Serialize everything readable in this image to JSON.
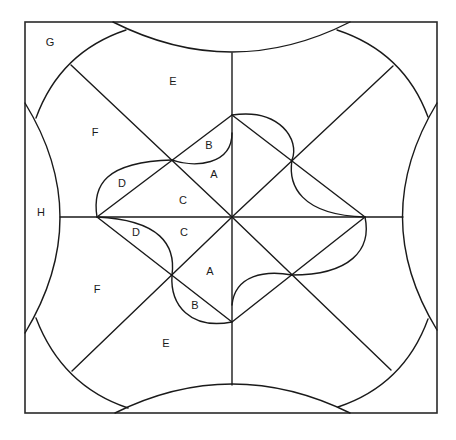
{
  "diagram": {
    "type": "quilt-block-pattern",
    "stroke_color": "#1a1a1a",
    "background": "#ffffff",
    "labels": [
      {
        "id": "G",
        "text": "G",
        "x": 50,
        "y": 42
      },
      {
        "id": "E-top",
        "text": "E",
        "x": 173,
        "y": 81
      },
      {
        "id": "F-top",
        "text": "F",
        "x": 95,
        "y": 132
      },
      {
        "id": "B-top",
        "text": "B",
        "x": 209,
        "y": 145
      },
      {
        "id": "A-top",
        "text": "A",
        "x": 214,
        "y": 174
      },
      {
        "id": "D-top",
        "text": "D",
        "x": 122,
        "y": 183
      },
      {
        "id": "C-top",
        "text": "C",
        "x": 183,
        "y": 200
      },
      {
        "id": "H",
        "text": "H",
        "x": 41,
        "y": 212
      },
      {
        "id": "D-bottom",
        "text": "D",
        "x": 136,
        "y": 232
      },
      {
        "id": "C-bottom",
        "text": "C",
        "x": 184,
        "y": 232
      },
      {
        "id": "A-bottom",
        "text": "A",
        "x": 210,
        "y": 271
      },
      {
        "id": "F-bottom",
        "text": "F",
        "x": 97,
        "y": 289
      },
      {
        "id": "B-bottom",
        "text": "B",
        "x": 195,
        "y": 305
      },
      {
        "id": "E-bottom",
        "text": "E",
        "x": 166,
        "y": 343
      }
    ]
  }
}
